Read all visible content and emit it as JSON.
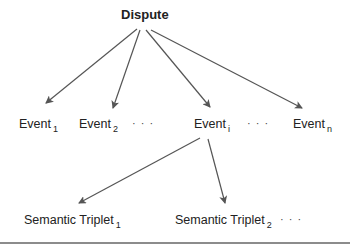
{
  "diagram": {
    "root": {
      "label": "Dispute"
    },
    "events": [
      {
        "label": "Event",
        "subscript": "1"
      },
      {
        "label": "Event",
        "subscript": "2"
      },
      {
        "label": "Event",
        "subscript": "i"
      },
      {
        "label": "Event",
        "subscript": "n"
      }
    ],
    "event_ellipses": [
      "· · ·",
      "· · ·"
    ],
    "triplets": [
      {
        "label": "Semantic Triplet",
        "subscript": "1"
      },
      {
        "label": "Semantic Triplet",
        "subscript": "2"
      }
    ],
    "triplet_ellipsis": "· · ·",
    "edges": [
      {
        "from": "Dispute",
        "to": "Event 1"
      },
      {
        "from": "Dispute",
        "to": "Event 2"
      },
      {
        "from": "Dispute",
        "to": "Event i"
      },
      {
        "from": "Dispute",
        "to": "Event n"
      },
      {
        "from": "Event i",
        "to": "Semantic Triplet 1"
      },
      {
        "from": "Event i",
        "to": "Semantic Triplet 2"
      }
    ],
    "colors": {
      "arrow": "#555555",
      "text": "#222222",
      "rule": "#8c8c8c"
    }
  }
}
